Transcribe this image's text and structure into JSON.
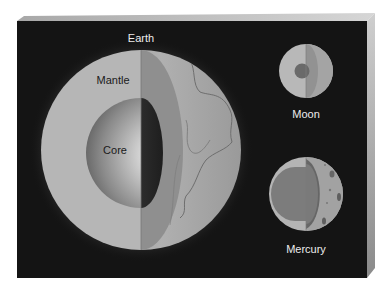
{
  "figure": {
    "colors": {
      "background": "#ffffff",
      "board_front": "#141414",
      "board_bevel_top": "#c8c8c8",
      "board_bevel_side": "#9a9a9a",
      "mantle": "#b4b4b4",
      "mantle_shadow": "#8c8c8c",
      "core_light": "#f4f4f4",
      "core_dark": "#5a5a5a",
      "surface": "#a8a8a8",
      "label_light": "#ececec",
      "label_dark": "#1a1a1a"
    }
  },
  "bodies": {
    "earth": {
      "label": "Earth",
      "cx": 141,
      "cy": 150,
      "r": 100,
      "core_r": 55
    },
    "moon": {
      "label": "Moon",
      "cx": 306,
      "cy": 71,
      "r": 27,
      "core_r": 8
    },
    "mercury": {
      "label": "Mercury",
      "cx": 306,
      "cy": 194,
      "r": 37,
      "core_r": 27
    }
  },
  "layers": {
    "mantle": "Mantle",
    "core": "Core"
  }
}
